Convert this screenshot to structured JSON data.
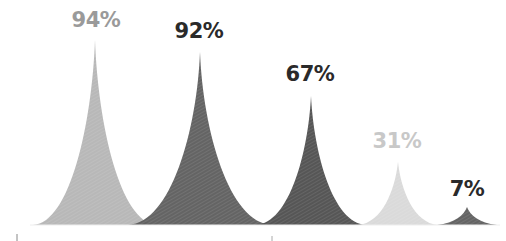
{
  "chart_data": {
    "type": "area",
    "title": "",
    "xlabel": "",
    "ylabel": "",
    "ylim": [
      0,
      100
    ],
    "grid": false,
    "legend": null,
    "categories": [
      "A",
      "B",
      "C",
      "D",
      "E"
    ],
    "values": [
      94,
      92,
      67,
      31,
      7
    ],
    "labels": [
      "94%",
      "92%",
      "67%",
      "31%",
      "7%"
    ],
    "colors": [
      "#b4b4b4",
      "#5a5a5a",
      "#4a4a4a",
      "#d6d6d6",
      "#5a5a5a"
    ],
    "label_colors": [
      "#9a9a9a",
      "#2a2a2a",
      "#2a2a2a",
      "#c8c8c8",
      "#2a2a2a"
    ]
  },
  "peaks": [
    {
      "label": "94%",
      "cx": 95,
      "half": 62,
      "peak_y": 40,
      "label_x": 96,
      "label_y": 8,
      "fill": "#b4b4b4",
      "label_color": "#9a9a9a"
    },
    {
      "label": "92%",
      "cx": 200,
      "half": 72,
      "peak_y": 52,
      "label_x": 199,
      "label_y": 19,
      "fill": "#5c5c5c",
      "label_color": "#2a2a2a"
    },
    {
      "label": "67%",
      "cx": 311,
      "half": 55,
      "peak_y": 96,
      "label_x": 310,
      "label_y": 62,
      "fill": "#4d4d4d",
      "label_color": "#2a2a2a"
    },
    {
      "label": "31%",
      "cx": 398,
      "half": 40,
      "peak_y": 162,
      "label_x": 397,
      "label_y": 129,
      "fill": "#d8d8d8",
      "label_color": "#c8c8c8"
    },
    {
      "label": "7%",
      "cx": 467,
      "half": 30,
      "peak_y": 207,
      "label_x": 467,
      "label_y": 177,
      "fill": "#5c5c5c",
      "label_color": "#2a2a2a"
    }
  ]
}
